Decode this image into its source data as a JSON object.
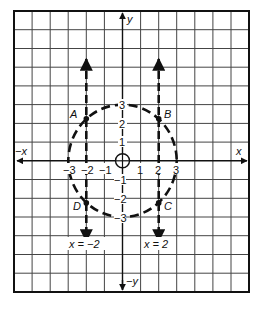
{
  "diagram": {
    "type": "coordinate-grid",
    "grid": {
      "cols": 13,
      "rows": 15,
      "origin_col": 6,
      "origin_row": 8
    },
    "axes": {
      "x_pos_label": "x",
      "x_neg_label": "−x",
      "y_pos_label": "y",
      "y_neg_label": "−y"
    },
    "x_ticks": [
      "−3",
      "−2",
      "−1",
      "1",
      "2",
      "3"
    ],
    "y_ticks": [
      "3",
      "2",
      "1",
      "−1",
      "−2",
      "−3"
    ],
    "circle": {
      "center": [
        0,
        0
      ],
      "radius": 3,
      "style": "dashed"
    },
    "vertical_lines": [
      {
        "equation": "x = −2",
        "x": -2,
        "style": "dashed",
        "arrows": "both"
      },
      {
        "equation": "x = 2",
        "x": 2,
        "style": "dashed",
        "arrows": "both"
      }
    ],
    "points": [
      {
        "label": "A",
        "x": -2,
        "y": 2.24
      },
      {
        "label": "B",
        "x": 2,
        "y": 2.24
      },
      {
        "label": "C",
        "x": 2,
        "y": -2.24
      },
      {
        "label": "D",
        "x": -2,
        "y": -2.24
      }
    ],
    "origin_marker": "circle-with-cross",
    "colors": {
      "line": "#111111",
      "grid": "#333333",
      "background": "#ffffff"
    }
  }
}
